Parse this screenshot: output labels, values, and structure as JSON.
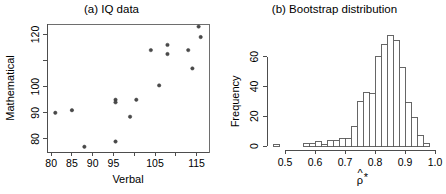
{
  "figure": {
    "panels": [
      {
        "id": "iq-scatter",
        "title": "(a) IQ data"
      },
      {
        "id": "bootstrap-histogram",
        "title": "(b) Bootstrap distribution"
      }
    ]
  },
  "chart_data": [
    {
      "type": "scatter",
      "title": "(a) IQ data",
      "xlabel": "Verbal",
      "ylabel": "Mathematical",
      "xlim": [
        79,
        118
      ],
      "ylim": [
        75,
        124
      ],
      "xticks": [
        80,
        85,
        90,
        95,
        100,
        105,
        110,
        115
      ],
      "xticklabels": [
        "80",
        "85",
        "90",
        "95",
        "",
        "105",
        "",
        "115"
      ],
      "yticks": [
        80,
        90,
        100,
        110,
        120
      ],
      "yticklabels": [
        "80",
        "90",
        "100",
        "",
        "120"
      ],
      "grid": false,
      "legend": "none",
      "x": [
        81,
        85,
        88,
        95.5,
        95.5,
        95.5,
        99,
        100.5,
        104,
        106,
        108,
        108,
        110.5,
        113,
        114,
        115.5,
        116
      ],
      "y": [
        90,
        91,
        77,
        95,
        94,
        79,
        88.5,
        95,
        114,
        100.5,
        116,
        112.5,
        75.5,
        114,
        107,
        123,
        119
      ],
      "points": [
        {
          "x": 81,
          "y": 90
        },
        {
          "x": 85,
          "y": 91
        },
        {
          "x": 88,
          "y": 77
        },
        {
          "x": 95.5,
          "y": 95
        },
        {
          "x": 95.5,
          "y": 94
        },
        {
          "x": 95.5,
          "y": 79
        },
        {
          "x": 99,
          "y": 88.5
        },
        {
          "x": 100.5,
          "y": 95
        },
        {
          "x": 104,
          "y": 114
        },
        {
          "x": 106,
          "y": 100.5
        },
        {
          "x": 108,
          "y": 116
        },
        {
          "x": 108,
          "y": 112.5
        },
        {
          "x": 113,
          "y": 114
        },
        {
          "x": 114,
          "y": 107
        },
        {
          "x": 115.5,
          "y": 123
        },
        {
          "x": 116,
          "y": 119
        }
      ]
    },
    {
      "type": "bar",
      "subtype": "histogram",
      "title": "(b) Bootstrap distribution",
      "xlabel": "ρ̂*",
      "xlabel_parts": {
        "symbol": "ρ",
        "hat": "^",
        "star": "*"
      },
      "ylabel": "Frequency",
      "xlim": [
        0.46,
        1.0
      ],
      "ylim": [
        0,
        78
      ],
      "xticks": [
        0.5,
        0.6,
        0.7,
        0.8,
        0.9,
        1.0
      ],
      "xticklabels": [
        "0.5",
        "0.6",
        "0.7",
        "0.8",
        "0.9",
        "1.0"
      ],
      "yticks": [
        0,
        20,
        40,
        60
      ],
      "yticklabels": [
        "0",
        "20",
        "40",
        "60"
      ],
      "grid": false,
      "legend": "none",
      "bin_width": 0.02,
      "bin_edges": [
        0.46,
        0.48,
        0.5,
        0.52,
        0.54,
        0.56,
        0.58,
        0.6,
        0.62,
        0.64,
        0.66,
        0.68,
        0.7,
        0.72,
        0.74,
        0.76,
        0.78,
        0.8,
        0.82,
        0.84,
        0.86,
        0.88,
        0.9,
        0.92,
        0.94,
        0.96,
        0.98
      ],
      "values": [
        1,
        0,
        0,
        0,
        0,
        2,
        2,
        3,
        1,
        4,
        4,
        5,
        5,
        13,
        30,
        36,
        35,
        60,
        68,
        74,
        71,
        53,
        29,
        19,
        7,
        2
      ],
      "bars": [
        {
          "left": 0.46,
          "right": 0.48,
          "count": 1
        },
        {
          "left": 0.48,
          "right": 0.5,
          "count": 0
        },
        {
          "left": 0.5,
          "right": 0.52,
          "count": 0
        },
        {
          "left": 0.52,
          "right": 0.54,
          "count": 0
        },
        {
          "left": 0.54,
          "right": 0.56,
          "count": 0
        },
        {
          "left": 0.56,
          "right": 0.58,
          "count": 2
        },
        {
          "left": 0.58,
          "right": 0.6,
          "count": 2
        },
        {
          "left": 0.6,
          "right": 0.62,
          "count": 3
        },
        {
          "left": 0.62,
          "right": 0.64,
          "count": 1
        },
        {
          "left": 0.64,
          "right": 0.66,
          "count": 4
        },
        {
          "left": 0.66,
          "right": 0.68,
          "count": 4
        },
        {
          "left": 0.68,
          "right": 0.7,
          "count": 5
        },
        {
          "left": 0.7,
          "right": 0.72,
          "count": 5
        },
        {
          "left": 0.72,
          "right": 0.74,
          "count": 13
        },
        {
          "left": 0.74,
          "right": 0.76,
          "count": 30
        },
        {
          "left": 0.76,
          "right": 0.78,
          "count": 36
        },
        {
          "left": 0.78,
          "right": 0.8,
          "count": 35
        },
        {
          "left": 0.8,
          "right": 0.82,
          "count": 60
        },
        {
          "left": 0.82,
          "right": 0.84,
          "count": 68
        },
        {
          "left": 0.84,
          "right": 0.86,
          "count": 74
        },
        {
          "left": 0.86,
          "right": 0.88,
          "count": 71
        },
        {
          "left": 0.88,
          "right": 0.9,
          "count": 53
        },
        {
          "left": 0.9,
          "right": 0.92,
          "count": 29
        },
        {
          "left": 0.92,
          "right": 0.94,
          "count": 19
        },
        {
          "left": 0.94,
          "right": 0.96,
          "count": 7
        },
        {
          "left": 0.96,
          "right": 0.98,
          "count": 2
        }
      ]
    }
  ]
}
